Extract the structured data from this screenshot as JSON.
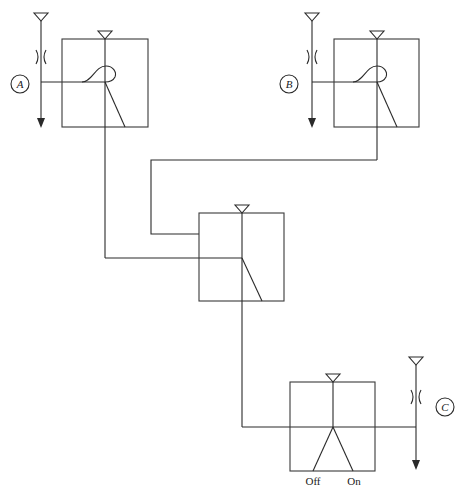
{
  "diagram": {
    "type": "switching circuit",
    "labels": {
      "A": "A",
      "B": "B",
      "C": "C"
    },
    "switch_states": {
      "off": "Off",
      "on": "On"
    },
    "stroke_color": "#2a2a2a",
    "background": "#ffffff"
  }
}
